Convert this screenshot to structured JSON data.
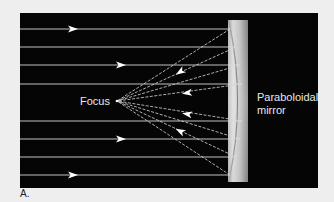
{
  "figure": {
    "panel_label": "A.",
    "focus_label": "Focus",
    "mirror_label_line1": "Paraboloidal",
    "mirror_label_line2": "mirror",
    "colors": {
      "page_background": "#eeeeee",
      "panel_background": "#050505",
      "ray_color": "#d8d8d8",
      "arrow_color": "#ffffff",
      "mirror_light": "#cfcfcf",
      "mirror_dark": "#8a8a8a",
      "text_light": "#e8e8e8",
      "text_dark": "#222222"
    },
    "geometry": {
      "panel": {
        "x": 20,
        "y": 13,
        "w": 298,
        "h": 175
      },
      "focus_point": {
        "x": 117,
        "y": 101
      },
      "mirror": {
        "x_left": 228,
        "x_right": 248,
        "y_top": 20,
        "y_bottom": 182
      },
      "incoming_rays": [
        {
          "y": 29,
          "end_x": 230
        },
        {
          "y": 47,
          "end_x": 236
        },
        {
          "y": 65,
          "end_x": 240
        },
        {
          "y": 84,
          "end_x": 242
        },
        {
          "y": 121,
          "end_x": 242
        },
        {
          "y": 139,
          "end_x": 240
        },
        {
          "y": 157,
          "end_x": 236
        },
        {
          "y": 175,
          "end_x": 230
        }
      ],
      "incoming_arrows": [
        {
          "x": 72,
          "y": 29
        },
        {
          "x": 120,
          "y": 65
        },
        {
          "x": 120,
          "y": 139
        },
        {
          "x": 72,
          "y": 175
        }
      ],
      "reflected_arrows": [
        {
          "x": 180,
          "y": 72
        },
        {
          "x": 187,
          "y": 93
        },
        {
          "x": 187,
          "y": 114
        },
        {
          "x": 180,
          "y": 131
        }
      ]
    }
  }
}
